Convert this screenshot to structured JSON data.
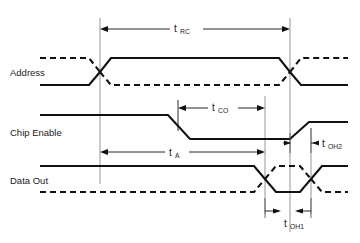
{
  "diagram": {
    "type": "timing-diagram",
    "background_color": "#ffffff",
    "line_color": "#111111",
    "refline_color": "#8a8a8a",
    "signals": [
      {
        "id": "address",
        "label": "Address",
        "label_x": 10,
        "label_y": 75,
        "row_top": 58,
        "row_bottom": 85,
        "valid_start": 100,
        "valid_end": 290,
        "style": "bus"
      },
      {
        "id": "chip-enable",
        "label": "Chip Enable",
        "label_x": 10,
        "label_y": 135,
        "row_top": 115,
        "row_bottom": 139,
        "fall_start": 168,
        "fall_end": 190,
        "rise_start": 290,
        "rise_end": 309,
        "style": "single"
      },
      {
        "id": "data-out",
        "label": "Data Out",
        "label_x": 10,
        "label_y": 183,
        "row_top": 166,
        "row_bottom": 192,
        "valid_start": 265,
        "valid_end": 311,
        "style": "bus-inverted"
      }
    ],
    "reference_lines": [
      {
        "id": "ref-addr-valid",
        "x": 100,
        "y1": 18,
        "y2": 184
      },
      {
        "id": "ref-ce-fall",
        "x": 178,
        "y1": 100,
        "y2": 131
      },
      {
        "id": "ref-data-valid",
        "x": 265,
        "y1": 96,
        "y2": 214
      },
      {
        "id": "ref-addr-change",
        "x": 290,
        "y1": 18,
        "y2": 232
      },
      {
        "id": "ref-data-end",
        "x": 311,
        "y1": 128,
        "y2": 214
      }
    ],
    "measurements": [
      {
        "id": "t-rc",
        "label": "t",
        "subscript": "RC",
        "label_x": 185,
        "label_y": 32,
        "line_y": 29,
        "x1": 100,
        "x2": 290,
        "gap_left": 170,
        "gap_right": 203,
        "arrows": "outward-ends",
        "description": "Read cycle time"
      },
      {
        "id": "t-co",
        "label": "t",
        "subscript": "CO",
        "label_x": 221,
        "label_y": 111,
        "line_y": 108,
        "x1": 178,
        "x2": 265,
        "gap_left": 208,
        "gap_right": 238,
        "arrows": "outward-ends",
        "description": "Chip enable to output valid"
      },
      {
        "id": "t-a",
        "label": "t",
        "subscript": "A",
        "label_x": 176,
        "label_y": 156,
        "line_y": 152,
        "x1": 100,
        "x2": 265,
        "gap_left": 165,
        "gap_right": 189,
        "arrows": "outward-ends",
        "description": "Address access time"
      },
      {
        "id": "t-oh1",
        "label": "t",
        "subscript": "OH1",
        "label_x": 296,
        "label_y": 227,
        "line_y": 211,
        "x1": 265,
        "x2": 311,
        "arrows": "inward-ends",
        "description": "Output hold from address change"
      },
      {
        "id": "t-oh2",
        "label": "t",
        "subscript": "OH2",
        "label_x": 326,
        "label_y": 147,
        "line_y": 143,
        "x1": 290,
        "x2": 311,
        "arrows": "inward-ends",
        "description": "Output hold from chip enable"
      }
    ],
    "geometry": {
      "wave_left": 40,
      "wave_right": 348,
      "transition_slope": 11
    }
  }
}
